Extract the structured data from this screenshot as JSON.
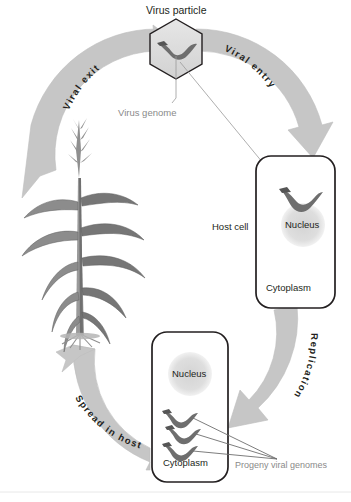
{
  "figure": {
    "type": "cycle-diagram",
    "background_color": "#ffffff",
    "arrow_color": "#c6c6c6",
    "arrow_edge_color": "#b3b3b3",
    "outline_color": "#231f20",
    "nucleus_color": "#dcdcdc",
    "genome_color": "#6e6e6e",
    "leader_color": "#9a9a9a",
    "gray_text_color": "#8a8a8a",
    "dark_text_color": "#231f20",
    "plant_color": "#7d7d7d"
  },
  "stages": [
    {
      "id": "viral-entry",
      "label": "Viral entry",
      "position": "top-right"
    },
    {
      "id": "replication",
      "label": "Replication",
      "position": "right"
    },
    {
      "id": "spread-in-host",
      "label": "Spread in host",
      "position": "bottom-left"
    },
    {
      "id": "viral-exit",
      "label": "Viral exit",
      "position": "top-left"
    }
  ],
  "labels": {
    "virus_particle": "Virus particle",
    "virus_genome": "Virus genome",
    "host_cell": "Host cell",
    "nucleus_top": "Nucleus",
    "cytoplasm_top": "Cytoplasm",
    "nucleus_bottom": "Nucleus",
    "cytoplasm_bottom": "Cytoplasm",
    "progeny_viral_genomes": "Progeny viral genomes"
  },
  "elements": {
    "virus_particle_shape": "hexagon",
    "host_cell_shape": "rounded-rectangle",
    "plant_species": "maize",
    "progeny_genome_count": 3
  }
}
